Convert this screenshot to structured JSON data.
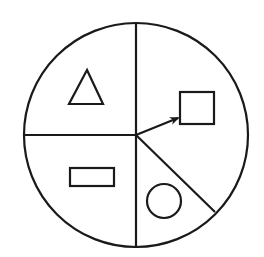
{
  "diagram": {
    "type": "divided-circle",
    "stroke_color": "#1a1a1a",
    "background": "#ffffff",
    "circle": {
      "cx": 136,
      "cy": 135,
      "r": 112
    },
    "dividers": [
      {
        "name": "vertical-divider",
        "x1": 136,
        "y1": 23,
        "x2": 136,
        "y2": 247
      },
      {
        "name": "horizontal-divider",
        "x1": 24,
        "y1": 135,
        "x2": 136,
        "y2": 135
      },
      {
        "name": "diagonal-divider",
        "x1": 136,
        "y1": 135,
        "x2": 216,
        "y2": 212
      }
    ],
    "sectors": [
      {
        "position": "upper-left",
        "shape": "triangle"
      },
      {
        "position": "right",
        "shape": "square"
      },
      {
        "position": "lower-left",
        "shape": "rectangle"
      },
      {
        "position": "lower-middle",
        "shape": "circle"
      }
    ],
    "shapes": {
      "triangle": {
        "points": "87,70 69,104 103,104"
      },
      "square": {
        "x": 180,
        "y": 92,
        "w": 34,
        "h": 32
      },
      "rectangle": {
        "x": 70,
        "y": 168,
        "w": 44,
        "h": 18
      },
      "small_circle": {
        "cx": 164,
        "cy": 201,
        "r": 17
      }
    },
    "arrow": {
      "from": [
        136,
        135
      ],
      "to": [
        178,
        118
      ],
      "points_to": "square"
    }
  }
}
